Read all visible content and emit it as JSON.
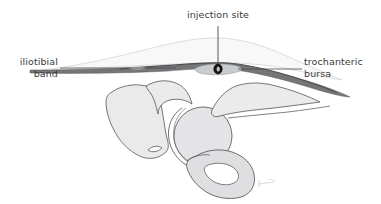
{
  "figure": {
    "labels": {
      "iliotibial_band": "iliotibial\nband",
      "trochanteric_bursa": "trochanteric\nbursa",
      "injection_site": "injection site"
    },
    "colors": {
      "background": "#ffffff",
      "text": "#3a3a3a",
      "leader_line": "#4a4a4a",
      "it_band": "#6f7173",
      "it_band_dark": "#4b4d4f",
      "bursa_fill": "#c9cbcd",
      "bone_fill": "#e9e9ea",
      "bone_outline": "#5e5f61",
      "skin_fill": "#f7f7f8",
      "skin_outline": "#cdcdcf",
      "injection_marker": "#1a1a1a"
    },
    "structures": [
      "skin and subcutaneous tissue contour",
      "iliotibial band",
      "trochanteric bursa",
      "injection needle",
      "ilium",
      "acetabulum",
      "femoral head",
      "greater trochanter",
      "obturator foramen",
      "ischium and pubis"
    ],
    "signature": "artist signature mark"
  }
}
